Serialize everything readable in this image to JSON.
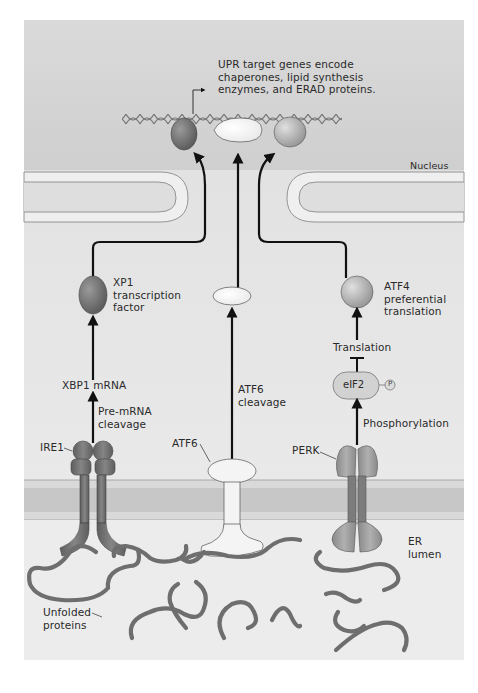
{
  "figure": {
    "colors": {
      "background": "#e4e4e4",
      "nucleus": "#d6d6d6",
      "cytoplasm": "#e6e6e6",
      "er_membrane": "#c9c9c9",
      "er_lumen": "#ececec",
      "ire1": "#6f6f6f",
      "atf6": "#f5f5f5",
      "perk": "#8e8e8e",
      "unfolded_protein": "#7a7a7a",
      "arrow": "#111111"
    }
  },
  "labels": {
    "upr_target": "UPR target genes encode\nchaperones, lipid synthesis\nenzymes, and ERAD proteins.",
    "nucleus": "Nucleus",
    "xp1": "XP1\ntranscription\nfactor",
    "xbp1_mrna": "XBP1 mRNA",
    "pre_mrna_cleavage": "Pre-mRNA\ncleavage",
    "ire1": "IRE1",
    "atf6_cleavage": "ATF6\ncleavage",
    "atf6": "ATF6",
    "atf4": "ATF4\npreferential\ntranslation",
    "translation": "Translation",
    "eif2": "eIF2",
    "phospho": "P",
    "phosphorylation": "Phosphorylation",
    "perk": "PERK",
    "er_lumen": "ER\nlumen",
    "unfolded_proteins": "Unfolded\nproteins"
  },
  "pathways": [
    {
      "sensor": "IRE1",
      "steps": [
        "Pre-mRNA cleavage",
        "XBP1 mRNA",
        "XP1 transcription factor"
      ]
    },
    {
      "sensor": "ATF6",
      "steps": [
        "ATF6 cleavage",
        "ATF6 fragment"
      ]
    },
    {
      "sensor": "PERK",
      "steps": [
        "Phosphorylation",
        "eIF2-P",
        "Translation (inhibited)",
        "ATF4 preferential translation"
      ]
    }
  ]
}
